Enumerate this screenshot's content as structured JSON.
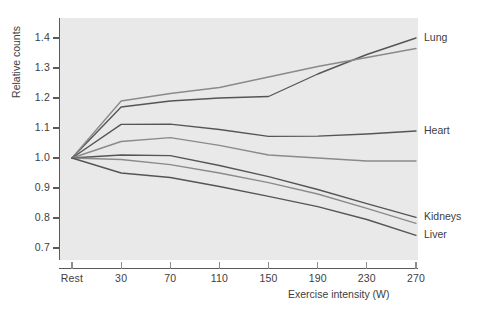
{
  "chart_data": {
    "type": "line",
    "title": "",
    "xlabel": "Exercise intensity (W)",
    "ylabel": "Relative counts",
    "x": [
      "Rest",
      "30",
      "70",
      "110",
      "150",
      "190",
      "230",
      "270"
    ],
    "x_numeric": [
      0,
      30,
      70,
      110,
      150,
      190,
      230,
      270
    ],
    "xtick_labels": [
      "Rest",
      "30",
      "70",
      "110",
      "150",
      "190",
      "230",
      "270"
    ],
    "ytick_labels": [
      "1.4",
      "1.3",
      "1.2",
      "1.1",
      "1.0",
      "0.9",
      "0.8",
      "0.7"
    ],
    "ytick_values": [
      1.4,
      1.3,
      1.2,
      1.1,
      1.0,
      0.9,
      0.8,
      0.7
    ],
    "ylim": [
      0.68,
      1.45
    ],
    "grid": false,
    "legend_position": "right-inline-labels",
    "series": [
      {
        "name": "Lung",
        "label": "Lung",
        "color": "#555555",
        "values": [
          1.0,
          1.17,
          1.19,
          1.2,
          1.205,
          1.28,
          1.345,
          1.4
        ]
      },
      {
        "name": "Lung-second",
        "label": "",
        "color": "#8a8a8a",
        "values": [
          1.0,
          1.19,
          1.215,
          1.235,
          1.27,
          1.305,
          1.335,
          1.365
        ]
      },
      {
        "name": "Heart",
        "label": "Heart",
        "color": "#555555",
        "values": [
          1.0,
          1.112,
          1.113,
          1.095,
          1.072,
          1.073,
          1.08,
          1.09
        ]
      },
      {
        "name": "Heart-second",
        "label": "",
        "color": "#8a8a8a",
        "values": [
          1.0,
          1.055,
          1.068,
          1.042,
          1.01,
          1.0,
          0.99,
          0.99
        ]
      },
      {
        "name": "Kidneys",
        "label": "Kidneys",
        "color": "#555555",
        "values": [
          1.0,
          1.01,
          1.008,
          0.975,
          0.938,
          0.895,
          0.848,
          0.802
        ]
      },
      {
        "name": "Kidneys-second",
        "label": "",
        "color": "#8a8a8a",
        "values": [
          1.0,
          0.995,
          0.978,
          0.95,
          0.918,
          0.88,
          0.832,
          0.782
        ]
      },
      {
        "name": "Liver",
        "label": "Liver",
        "color": "#555555",
        "values": [
          1.0,
          0.95,
          0.935,
          0.905,
          0.872,
          0.838,
          0.795,
          0.742
        ]
      }
    ]
  },
  "axes": {
    "y_title": "Relative counts",
    "x_title": "Exercise intensity (W)"
  },
  "labels": {
    "lung": "Lung",
    "heart": "Heart",
    "kidneys": "Kidneys",
    "liver": "Liver"
  },
  "colors": {
    "plot_background": "#e9e9e9",
    "page_background": "#ffffff",
    "axis": "#5a5a5a",
    "text": "#3d3d3d",
    "line_dark": "#555555",
    "line_light": "#8a8a8a"
  }
}
